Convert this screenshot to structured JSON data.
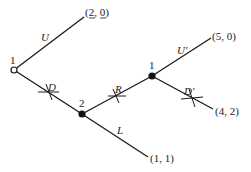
{
  "diagram": {
    "type": "extensive-form game tree",
    "nodes": [
      {
        "id": "root",
        "player": "1",
        "style": "open"
      },
      {
        "id": "n2",
        "player": "2",
        "style": "filled"
      },
      {
        "id": "n3",
        "player": "1",
        "style": "filled"
      }
    ],
    "actions": {
      "U": "U",
      "D": "D",
      "R": "R",
      "L": "L",
      "U_prime": "U'",
      "D_prime": "D'"
    },
    "payoffs": {
      "after_U": {
        "open": "(",
        "a": "2",
        "sep": ", ",
        "b": "0",
        "close": ")",
        "underlined": [
          "2",
          "0"
        ]
      },
      "after_L": "(1, 1)",
      "after_U_prime": "(5, 0)",
      "after_D_prime": "(4, 2)"
    },
    "crossed_branches": [
      "D",
      "R",
      "D'"
    ]
  }
}
